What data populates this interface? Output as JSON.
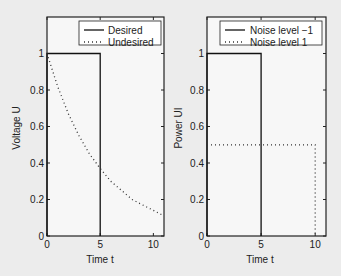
{
  "chart_data": [
    {
      "type": "line",
      "title": "",
      "xlabel": "Time t",
      "ylabel": "Voltage U",
      "xlim": [
        0,
        11
      ],
      "ylim": [
        0,
        1.2
      ],
      "xticks": [
        "0",
        "5",
        "10"
      ],
      "yticks": [
        "0",
        "0.2",
        "0.4",
        "0.6",
        "0.8",
        "1"
      ],
      "grid": false,
      "legend_position": "upper right",
      "series": [
        {
          "name": "Desired",
          "style": "solid",
          "x": [
            0,
            0,
            5,
            5
          ],
          "y": [
            0,
            1,
            1,
            0
          ]
        },
        {
          "name": "Undesired",
          "style": "dotted",
          "x": [
            0,
            1,
            2,
            3,
            4,
            5,
            6,
            7,
            8,
            9,
            10,
            11
          ],
          "y": [
            1.0,
            0.82,
            0.67,
            0.55,
            0.45,
            0.37,
            0.3,
            0.25,
            0.2,
            0.17,
            0.14,
            0.11
          ]
        }
      ]
    },
    {
      "type": "line",
      "title": "",
      "xlabel": "Time t",
      "ylabel": "Power UI",
      "xlim": [
        0,
        11
      ],
      "ylim": [
        0,
        1.2
      ],
      "xticks": [
        "0",
        "5",
        "10"
      ],
      "yticks": [
        "0",
        "0.2",
        "0.4",
        "0.6",
        "0.8",
        "1"
      ],
      "grid": false,
      "legend_position": "upper right",
      "series": [
        {
          "name": "Noise level −1",
          "style": "solid",
          "x": [
            0,
            0,
            5,
            5
          ],
          "y": [
            0,
            1,
            1,
            0
          ]
        },
        {
          "name": "Noise level 1",
          "style": "dotted",
          "x": [
            0,
            10,
            10
          ],
          "y": [
            0.5,
            0.5,
            0
          ]
        }
      ]
    }
  ],
  "left": {
    "ylabel": "Voltage U",
    "xlabel": "Time t",
    "legend": [
      "Desired",
      "Undesired"
    ]
  },
  "right": {
    "ylabel": "Power UI",
    "xlabel": "Time t",
    "legend": [
      "Noise level −1",
      "Noise level 1"
    ]
  },
  "ticks": {
    "x": [
      "0",
      "5",
      "10"
    ],
    "y": [
      "0",
      "0.2",
      "0.4",
      "0.6",
      "0.8",
      "1"
    ]
  }
}
